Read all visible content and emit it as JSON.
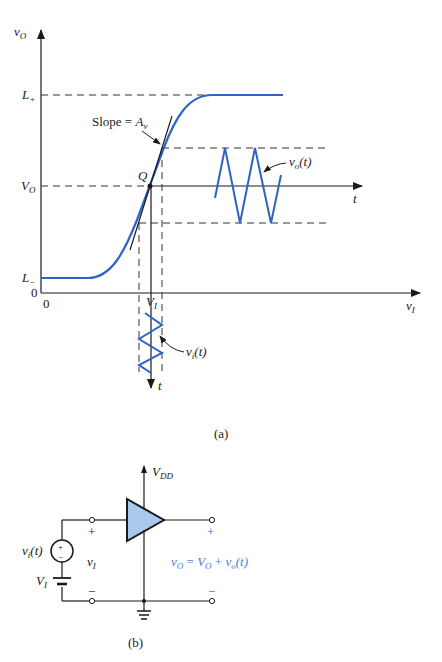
{
  "figure_a": {
    "caption": "(a)",
    "y_axis_label": "v",
    "y_axis_sub": "O",
    "x_axis_label": "v",
    "x_axis_sub": "I",
    "origin_x_label": "0",
    "origin_y_label": "0",
    "level_labels": {
      "l_plus": "L",
      "l_plus_sub": "+",
      "v_o": "V",
      "v_o_sub": "O",
      "l_minus": "L",
      "l_minus_sub": "−"
    },
    "slope_label": "Slope = ",
    "slope_var": "A",
    "slope_sub": "v",
    "q_label": "Q",
    "vi_label": "V",
    "vi_sub": "I",
    "output_signal_label": "v",
    "output_signal_sub": "o",
    "output_signal_arg": "(t)",
    "output_time_label": "t",
    "input_signal_label": "v",
    "input_signal_sub": "i",
    "input_signal_arg": "(t)",
    "input_time_label": "t"
  },
  "figure_b": {
    "caption": "(b)",
    "supply_label": "V",
    "supply_sub": "DD",
    "source_label": "v",
    "source_sub": "i",
    "source_arg": "(t)",
    "source_plus": "+",
    "source_minus": "−",
    "bias_label": "V",
    "bias_sub": "I",
    "input_label": "v",
    "input_sub": "I",
    "input_plus": "+",
    "input_minus": "−",
    "output_plus": "+",
    "output_minus": "−",
    "output_eq_v": "v",
    "output_eq_vsub": "O",
    "output_eq_mid": " = ",
    "output_eq_V": "V",
    "output_eq_Vsub": "O",
    "output_eq_plus": " + ",
    "output_eq_vo": "v",
    "output_eq_vosub": "o",
    "output_eq_arg": "(t)"
  },
  "colors": {
    "curve": "#2f63c4",
    "amplifier_fill": "#a9c8ee",
    "ink": "#1a1a1a",
    "equation": "#4a7fd0"
  }
}
